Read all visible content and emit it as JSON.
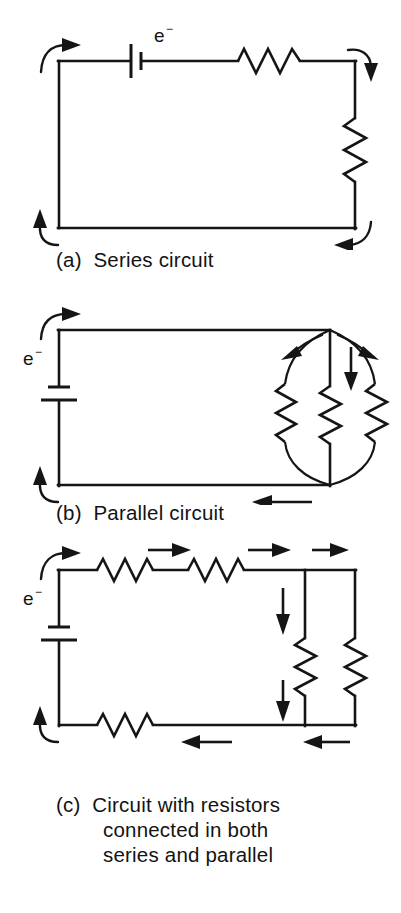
{
  "figure": {
    "background_color": "#ffffff",
    "ink_color": "#151515"
  },
  "panels": [
    {
      "id": "a",
      "caption_label": "(a)",
      "caption_text": "Series circuit",
      "electron_label": "e",
      "electron_superscript": "−",
      "components": {
        "battery_count": 1,
        "battery_orientation": "horizontal",
        "resistor_count": 2,
        "resistor_positions": [
          "top-right horizontal",
          "right vertical"
        ],
        "current_arrows": 4,
        "arrow_style": "curved"
      }
    },
    {
      "id": "b",
      "caption_label": "(b)",
      "caption_text": "Parallel circuit",
      "electron_label": "e",
      "electron_superscript": "−",
      "components": {
        "battery_count": 1,
        "battery_orientation": "vertical",
        "resistor_count": 3,
        "resistor_positions": [
          "left curved branch",
          "center straight branch",
          "right curved branch"
        ],
        "current_arrows": 6,
        "arrow_style": "mixed"
      }
    },
    {
      "id": "c",
      "caption_label": "(c)",
      "caption_line1": "Circuit with resistors",
      "caption_line2": "connected in both",
      "caption_line3": "series and parallel",
      "electron_label": "e",
      "electron_superscript": "−",
      "components": {
        "battery_count": 1,
        "battery_orientation": "vertical",
        "resistor_count": 5,
        "resistor_positions": [
          "top-left horizontal series",
          "top-middle horizontal series",
          "right inner vertical parallel",
          "right outer vertical parallel",
          "bottom horizontal series"
        ],
        "current_arrows": 9,
        "arrow_style": "mixed"
      }
    }
  ]
}
